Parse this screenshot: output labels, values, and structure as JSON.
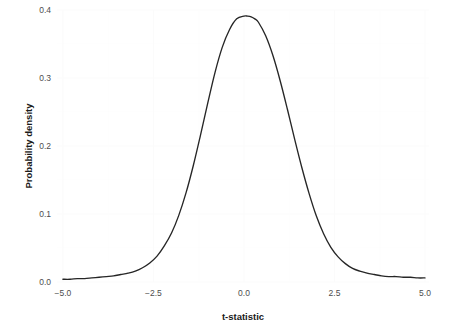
{
  "chart_data": {
    "type": "line",
    "title": "",
    "subtitle": "",
    "xlabel": "t-statistic",
    "ylabel": "Probability density",
    "xlim": [
      -5.0,
      5.0
    ],
    "ylim": [
      0.0,
      0.4
    ],
    "grid": true,
    "legend": "none",
    "x_ticks": [
      "-5.0",
      "-2.5",
      "0.0",
      "2.5",
      "5.0"
    ],
    "x_tick_values": [
      -5.0,
      -2.5,
      0.0,
      2.5,
      5.0
    ],
    "y_ticks": [
      "0.0",
      "0.1",
      "0.2",
      "0.3",
      "0.4"
    ],
    "y_tick_values": [
      0.0,
      0.1,
      0.2,
      0.3,
      0.4
    ],
    "series": [
      {
        "name": "t-distribution density",
        "color": "#262626",
        "x": [
          -5.0,
          -4.8,
          -4.6,
          -4.4,
          -4.2,
          -4.0,
          -3.8,
          -3.6,
          -3.4,
          -3.2,
          -3.0,
          -2.8,
          -2.6,
          -2.4,
          -2.2,
          -2.0,
          -1.8,
          -1.6,
          -1.4,
          -1.2,
          -1.0,
          -0.8,
          -0.6,
          -0.4,
          -0.2,
          0.0,
          0.1,
          0.2,
          0.3,
          0.4,
          0.6,
          0.8,
          1.0,
          1.2,
          1.4,
          1.6,
          1.8,
          2.0,
          2.2,
          2.4,
          2.6,
          2.8,
          3.0,
          3.2,
          3.4,
          3.6,
          3.8,
          4.0,
          4.2,
          4.4,
          4.6,
          4.8,
          5.0
        ],
        "y": [
          0.004,
          0.004,
          0.005,
          0.005,
          0.006,
          0.007,
          0.008,
          0.009,
          0.011,
          0.013,
          0.016,
          0.021,
          0.028,
          0.038,
          0.053,
          0.072,
          0.098,
          0.131,
          0.171,
          0.216,
          0.263,
          0.308,
          0.345,
          0.371,
          0.387,
          0.391,
          0.391,
          0.39,
          0.387,
          0.382,
          0.362,
          0.333,
          0.296,
          0.254,
          0.21,
          0.168,
          0.13,
          0.097,
          0.071,
          0.051,
          0.037,
          0.027,
          0.02,
          0.016,
          0.013,
          0.011,
          0.009,
          0.008,
          0.008,
          0.007,
          0.007,
          0.006,
          0.006
        ]
      }
    ],
    "peak": {
      "x": 0.0,
      "y": 0.391
    }
  },
  "axes": {
    "x": {
      "title": "t-statistic",
      "ticks": [
        {
          "label": "-5.0",
          "value": -5.0
        },
        {
          "label": "-2.5",
          "value": -2.5
        },
        {
          "label": "0.0",
          "value": 0.0
        },
        {
          "label": "2.5",
          "value": 2.5
        },
        {
          "label": "5.0",
          "value": 5.0
        }
      ]
    },
    "y": {
      "title": "Probability density",
      "ticks": [
        {
          "label": "0.0",
          "value": 0.0
        },
        {
          "label": "0.1",
          "value": 0.1
        },
        {
          "label": "0.2",
          "value": 0.2
        },
        {
          "label": "0.3",
          "value": 0.3
        },
        {
          "label": "0.4",
          "value": 0.4
        }
      ]
    }
  },
  "style": {
    "background": "#ffffff",
    "curve_color": "#262626",
    "tick_label_color": "#4d4d4d",
    "axis_title_color": "#1a1a1a",
    "gridline_color": "#fbfbfb"
  }
}
